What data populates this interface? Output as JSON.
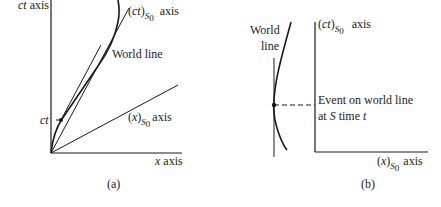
{
  "panel_a": {
    "caption": "(a)",
    "vertical_axis_label_italic": "ct",
    "vertical_axis_label": " axis",
    "horizontal_axis_label_italic": "x",
    "horizontal_axis_label": " axis",
    "ct_s0_axis": {
      "prefix": "(",
      "var": "ct",
      "suffix": ")",
      "sub": "S",
      "sub2": "0",
      "label": "axis"
    },
    "x_s0_axis": {
      "prefix": "(",
      "var": "x",
      "suffix": ")",
      "sub": "S",
      "sub2": "0",
      "label": "axis"
    },
    "world_line_label": "World line",
    "event_label": "ct"
  },
  "panel_b": {
    "caption": "(b)",
    "world_line_label_1": "World",
    "world_line_label_2": "line",
    "ct_s0_axis": {
      "prefix": "(",
      "var": "ct",
      "suffix": ")",
      "sub": "S",
      "sub2": "0",
      "label": "axis"
    },
    "x_s0_axis": {
      "prefix": "(",
      "var": "x",
      "suffix": ")",
      "sub": "S",
      "sub2": "0",
      "label": "axis"
    },
    "event_label_line1": "Event on world line",
    "event_label_line2_prefix": "at ",
    "event_label_line2_S": "S",
    "event_label_line2_mid": " time ",
    "event_label_line2_t": "t"
  },
  "colors": {
    "ink": "#1a1a1a",
    "background": "#ffffff"
  }
}
